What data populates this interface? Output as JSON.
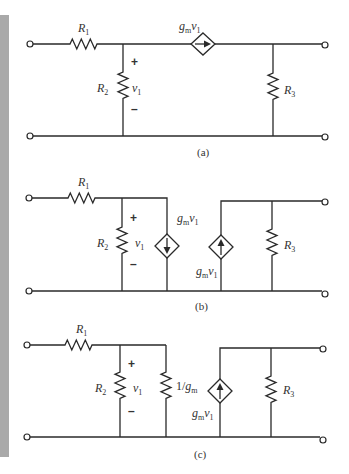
{
  "figure": {
    "circuits": [
      {
        "caption": "(a)",
        "components": {
          "r1": {
            "name": "R",
            "sub": "1"
          },
          "r2": {
            "name": "R",
            "sub": "2"
          },
          "r3": {
            "name": "R",
            "sub": "3"
          },
          "v1": {
            "name": "v",
            "sub": "1"
          },
          "plus": "+",
          "minus": "–",
          "source": {
            "g": "g",
            "gsub": "m",
            "v": "v",
            "vsub": "1",
            "direction": "right"
          }
        }
      },
      {
        "caption": "(b)",
        "components": {
          "r1": {
            "name": "R",
            "sub": "1"
          },
          "r2": {
            "name": "R",
            "sub": "2"
          },
          "r3": {
            "name": "R",
            "sub": "3"
          },
          "v1": {
            "name": "v",
            "sub": "1"
          },
          "plus": "+",
          "minus": "–",
          "source_left": {
            "g": "g",
            "gsub": "m",
            "v": "v",
            "vsub": "1",
            "direction": "down"
          },
          "source_right": {
            "g": "g",
            "gsub": "m",
            "v": "v",
            "vsub": "1",
            "direction": "up"
          }
        }
      },
      {
        "caption": "(c)",
        "components": {
          "r1": {
            "name": "R",
            "sub": "1"
          },
          "r2": {
            "name": "R",
            "sub": "2"
          },
          "r3": {
            "name": "R",
            "sub": "3"
          },
          "v1": {
            "name": "v",
            "sub": "1"
          },
          "plus": "+",
          "minus": "–",
          "r_gm": {
            "prefix": "1/",
            "g": "g",
            "gsub": "m"
          },
          "source_right": {
            "g": "g",
            "gsub": "m",
            "v": "v",
            "vsub": "1",
            "direction": "up"
          }
        }
      }
    ]
  }
}
